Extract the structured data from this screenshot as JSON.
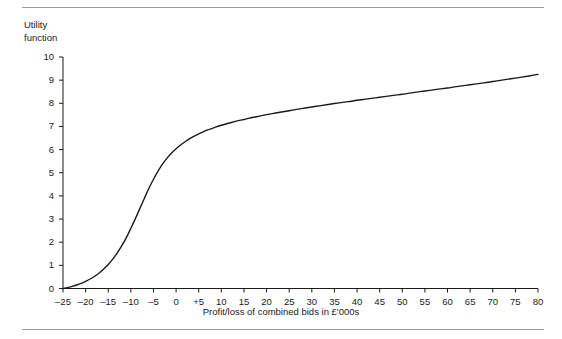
{
  "figure": {
    "y_axis_title_line1": "Utility",
    "y_axis_title_line2": "function",
    "x_axis_title": "Profit/loss of combined bids in £'000s"
  },
  "chart_data": {
    "type": "line",
    "title": "",
    "subtitle": "",
    "xlabel": "Profit/loss of combined bids in £'000s",
    "ylabel": "Utility function",
    "xlim": [
      -25,
      80
    ],
    "ylim": [
      0,
      10
    ],
    "grid": false,
    "legend": false,
    "legend_position": "none",
    "xticks": [
      -25,
      -20,
      -15,
      -10,
      -5,
      0,
      5,
      10,
      15,
      20,
      25,
      30,
      35,
      40,
      45,
      50,
      55,
      60,
      65,
      70,
      75,
      80
    ],
    "xtick_labels": [
      "–25",
      "–20",
      "–15",
      "–10",
      "–5",
      "0",
      "+5",
      "10",
      "15",
      "20",
      "25",
      "30",
      "35",
      "40",
      "45",
      "50",
      "55",
      "60",
      "65",
      "70",
      "75",
      "80"
    ],
    "yticks": [
      0,
      1,
      2,
      3,
      4,
      5,
      6,
      7,
      8,
      9,
      10
    ],
    "ytick_labels": [
      "0",
      "1",
      "2",
      "3",
      "4",
      "5",
      "6",
      "7",
      "8",
      "9",
      "10"
    ],
    "line_color": "#1a1a1a",
    "line_width": 1.4,
    "series": [
      {
        "name": "Utility function",
        "x": [
          -25,
          -24,
          -23,
          -22,
          -21,
          -20,
          -19,
          -18,
          -17,
          -16,
          -15,
          -14,
          -13,
          -12,
          -11,
          -10,
          -9,
          -8,
          -7,
          -6,
          -5,
          -4,
          -3,
          -2,
          -1,
          0,
          1,
          2,
          3,
          4,
          5,
          6,
          7,
          8,
          9,
          10,
          12,
          14,
          15,
          16,
          18,
          20,
          22,
          25,
          28,
          30,
          32,
          35,
          38,
          40,
          42,
          45,
          48,
          50,
          52,
          55,
          58,
          60,
          62,
          65,
          68,
          70,
          72,
          75,
          78,
          80
        ],
        "values": [
          0.0,
          0.04,
          0.09,
          0.15,
          0.22,
          0.31,
          0.41,
          0.53,
          0.67,
          0.84,
          1.04,
          1.27,
          1.54,
          1.85,
          2.2,
          2.6,
          3.02,
          3.46,
          3.9,
          4.33,
          4.72,
          5.07,
          5.37,
          5.63,
          5.85,
          6.04,
          6.2,
          6.34,
          6.47,
          6.58,
          6.68,
          6.77,
          6.85,
          6.92,
          6.99,
          7.05,
          7.16,
          7.26,
          7.3,
          7.35,
          7.43,
          7.51,
          7.58,
          7.68,
          7.78,
          7.84,
          7.9,
          7.99,
          8.07,
          8.13,
          8.18,
          8.26,
          8.34,
          8.39,
          8.45,
          8.53,
          8.61,
          8.66,
          8.72,
          8.8,
          8.88,
          8.94,
          9.0,
          9.09,
          9.18,
          9.25
        ]
      }
    ]
  }
}
